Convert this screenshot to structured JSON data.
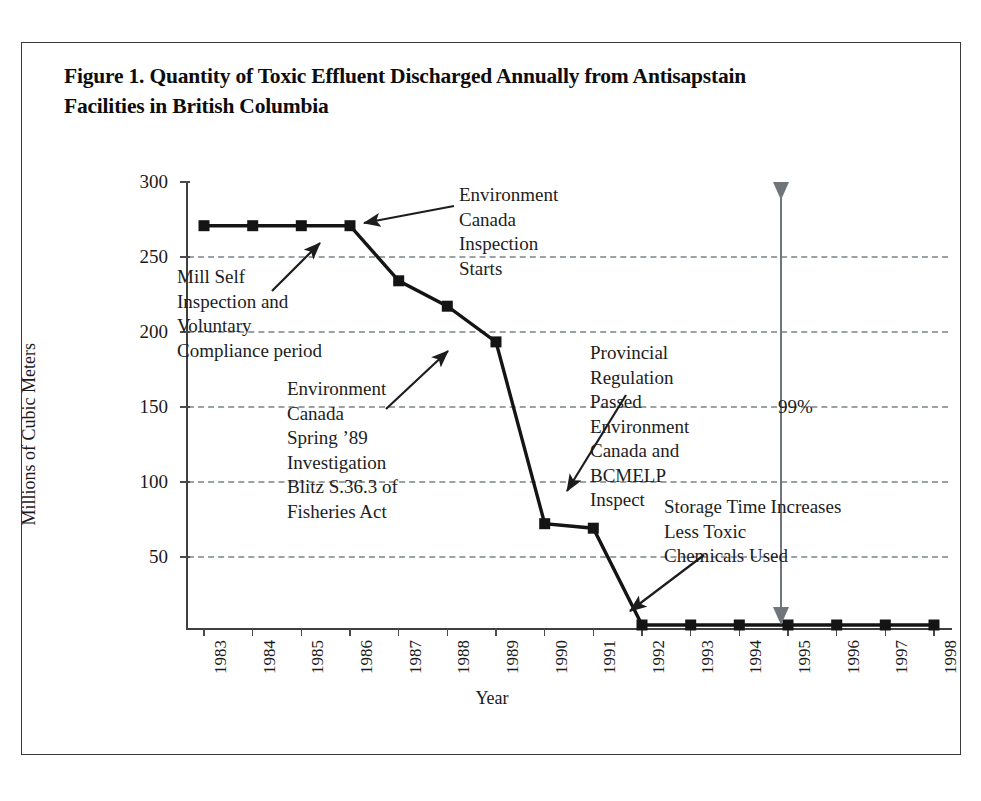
{
  "figure": {
    "title": "Figure 1. Quantity of Toxic Effluent Discharged Annually from Antisapstain Facilities in British Columbia"
  },
  "chart_data": {
    "type": "line",
    "title": "Figure 1. Quantity of Toxic Effluent Discharged Annually from Antisapstain Facilities in British Columbia",
    "xlabel": "Year",
    "ylabel": "Millions of Cubic Meters",
    "categories": [
      "1983",
      "1984",
      "1985",
      "1986",
      "1987",
      "1988",
      "1989",
      "1990",
      "1991",
      "1992",
      "1993",
      "1994",
      "1995",
      "1996",
      "1997",
      "1998"
    ],
    "values": [
      270,
      270,
      270,
      270,
      233,
      216,
      192,
      70,
      67,
      2,
      2,
      2,
      2,
      2,
      2,
      2
    ],
    "series": [
      {
        "name": "Toxic effluent discharged",
        "values": [
          270,
          270,
          270,
          270,
          233,
          216,
          192,
          70,
          67,
          2,
          2,
          2,
          2,
          2,
          2,
          2
        ]
      }
    ],
    "ylim": [
      0,
      300
    ],
    "yticks": [
      50,
      100,
      150,
      200,
      250,
      300
    ],
    "ytick_labels": [
      "50",
      "100",
      "150",
      "200",
      "250",
      "300"
    ],
    "grid": "horizontal-dashed",
    "legend": "none",
    "marker": "square",
    "line_color": "#141414",
    "grid_color": "#9aa2a6",
    "annotations": [
      {
        "id": "mill-self",
        "text": "Mill Self\nInspection and\nVoluntary\nCompliance period",
        "points_to": "1985-1986 plateau"
      },
      {
        "id": "environment-canada-inspection",
        "text": "Environment\nCanada\nInspection\nStarts",
        "points_to": "1986"
      },
      {
        "id": "environment-canada-spring-89",
        "text": "Environment\nCanada\nSpring ’89\nInvestigation\nBlitz S.36.3 of\nFisheries Act",
        "points_to": "1989"
      },
      {
        "id": "provincial-regulation",
        "text": "Provincial\nRegulation\nPassed\nEnvironment\nCanada and\nBCMELP\nInspect",
        "points_to": "1991"
      },
      {
        "id": "storage-time",
        "text": "Storage Time Increases\nLess Toxic\nChemicals Used",
        "points_to": "1992"
      },
      {
        "id": "percent-reduction",
        "text": "99%",
        "type": "double-arrow-span",
        "from_value": 270,
        "to_value": 2
      }
    ]
  },
  "axes": {
    "y_title": "Millions of Cubic Meters",
    "x_title": "Year",
    "y_tick_labels": [
      "300",
      "250",
      "200",
      "150",
      "100",
      "50"
    ],
    "x_tick_labels": [
      "1983",
      "1984",
      "1985",
      "1986",
      "1987",
      "1988",
      "1989",
      "1990",
      "1991",
      "1992",
      "1993",
      "1994",
      "1995",
      "1996",
      "1997",
      "1998"
    ]
  },
  "annotations": {
    "mill_self": "Mill Self\nInspection and\nVoluntary\nCompliance period",
    "ec_inspection": "Environment\nCanada\nInspection\nStarts",
    "spring_89": "Environment\nCanada\nSpring ’89\nInvestigation\nBlitz S.36.3 of\nFisheries Act",
    "provincial": "Provincial\nRegulation\nPassed\nEnvironment\nCanada and\nBCMELP\nInspect",
    "storage": "Storage Time Increases\nLess Toxic\nChemicals Used",
    "percent": "99%"
  },
  "colors": {
    "line": "#141414",
    "grid": "#9aa2a6",
    "axis": "#3f3f3f",
    "frame": "#3a3a3a",
    "arrow": "#6f7579",
    "text": "#1a1a1a"
  }
}
